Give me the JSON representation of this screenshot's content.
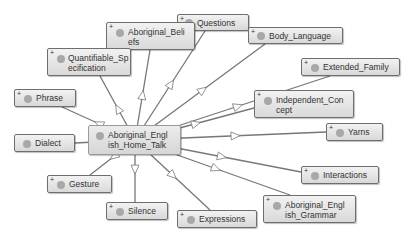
{
  "diagram": {
    "type": "ontology-graph",
    "center": {
      "id": "center",
      "label": "Aboriginal_Engl\nish_Home_Talk",
      "expand": false
    },
    "nodes": [
      {
        "id": "questions",
        "label": "Questions",
        "expand": true
      },
      {
        "id": "aboriginal_beliefs",
        "label": "Aboriginal_Beli\nefs",
        "expand": true
      },
      {
        "id": "body_language",
        "label": "Body_Language",
        "expand": true
      },
      {
        "id": "quantifiable_specification",
        "label": "Quantifiable_Sp\necification",
        "expand": true
      },
      {
        "id": "extended_family",
        "label": "Extended_Family",
        "expand": true
      },
      {
        "id": "phrase",
        "label": "Phrase",
        "expand": true
      },
      {
        "id": "independent_concept",
        "label": "Independent_Con\ncept",
        "expand": true
      },
      {
        "id": "dialect",
        "label": "Dialect",
        "expand": false
      },
      {
        "id": "yarns",
        "label": "Yarns",
        "expand": true
      },
      {
        "id": "gesture",
        "label": "Gesture",
        "expand": true
      },
      {
        "id": "interactions",
        "label": "Interactions",
        "expand": true
      },
      {
        "id": "silence",
        "label": "Silence",
        "expand": true
      },
      {
        "id": "expressions",
        "label": "Expressions",
        "expand": true
      },
      {
        "id": "aboriginal_english_grammar",
        "label": "Aboriginal_Engl\nish_Grammar",
        "expand": true
      }
    ],
    "edges": [
      {
        "from": "center",
        "to": "questions"
      },
      {
        "from": "center",
        "to": "aboriginal_beliefs"
      },
      {
        "from": "center",
        "to": "body_language"
      },
      {
        "from": "center",
        "to": "quantifiable_specification"
      },
      {
        "from": "center",
        "to": "extended_family"
      },
      {
        "from": "center",
        "to": "phrase"
      },
      {
        "from": "center",
        "to": "independent_concept"
      },
      {
        "from": "center",
        "to": "dialect"
      },
      {
        "from": "center",
        "to": "yarns"
      },
      {
        "from": "center",
        "to": "gesture"
      },
      {
        "from": "center",
        "to": "interactions"
      },
      {
        "from": "center",
        "to": "silence"
      },
      {
        "from": "center",
        "to": "expressions"
      },
      {
        "from": "center",
        "to": "aboriginal_english_grammar"
      }
    ],
    "colors": {
      "node_fill": "#e3e3e3",
      "node_border": "#6e6e6e",
      "edge": "#777777",
      "dot": "#a8a8a8"
    }
  }
}
